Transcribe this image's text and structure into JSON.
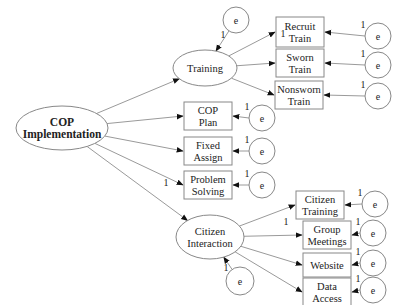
{
  "diagram": {
    "type": "structural-equation-model",
    "root": {
      "id": "cop",
      "label_lines": [
        "COP",
        "Implementation"
      ]
    },
    "latents": [
      {
        "id": "training",
        "label_lines": [
          "Training"
        ],
        "error_label": "e",
        "error_weight": "1"
      },
      {
        "id": "citizen",
        "label_lines": [
          "Citizen",
          "Interaction"
        ],
        "error_label": "e",
        "error_weight": "1"
      }
    ],
    "indicators": [
      {
        "id": "recruit",
        "parent": "training",
        "label_lines": [
          "Recruit",
          "Train"
        ],
        "path_weight": "1",
        "error_label": "e",
        "error_weight": "1"
      },
      {
        "id": "sworn",
        "parent": "training",
        "label_lines": [
          "Sworn",
          "Train"
        ],
        "path_weight": "",
        "error_label": "e",
        "error_weight": "1"
      },
      {
        "id": "nonsworn",
        "parent": "training",
        "label_lines": [
          "Nonsworn",
          "Train"
        ],
        "path_weight": "",
        "error_label": "e",
        "error_weight": "1"
      },
      {
        "id": "copplan",
        "parent": "cop",
        "label_lines": [
          "COP",
          "Plan"
        ],
        "path_weight": "",
        "error_label": "e",
        "error_weight": "1"
      },
      {
        "id": "fixed",
        "parent": "cop",
        "label_lines": [
          "Fixed",
          "Assign"
        ],
        "path_weight": "",
        "error_label": "e",
        "error_weight": "1"
      },
      {
        "id": "problem",
        "parent": "cop",
        "label_lines": [
          "Problem",
          "Solving"
        ],
        "path_weight": "1",
        "error_label": "e",
        "error_weight": "1"
      },
      {
        "id": "citizentraining",
        "parent": "citizen",
        "label_lines": [
          "Citizen",
          "Training"
        ],
        "path_weight": "",
        "error_label": "e",
        "error_weight": "1"
      },
      {
        "id": "group",
        "parent": "citizen",
        "label_lines": [
          "Group",
          "Meetings"
        ],
        "path_weight": "1",
        "error_label": "e",
        "error_weight": "1"
      },
      {
        "id": "website",
        "parent": "citizen",
        "label_lines": [
          "Website"
        ],
        "path_weight": "",
        "error_label": "e",
        "error_weight": "1"
      },
      {
        "id": "data",
        "parent": "citizen",
        "label_lines": [
          "Data",
          "Access"
        ],
        "path_weight": "",
        "error_label": "e",
        "error_weight": "1"
      }
    ]
  }
}
